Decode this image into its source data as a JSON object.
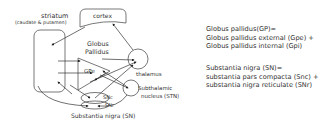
{
  "diagram": {
    "nodes": {
      "striatum": {
        "label": "striatum",
        "sublabel": "(caudate & putamen)"
      },
      "cortex": {
        "label": "cortex"
      },
      "globus_pallidus": {
        "label_line1": "Globus",
        "label_line2": "Pallidus"
      },
      "gpe": {
        "label": "GPe"
      },
      "gpi": {
        "label": "GPi"
      },
      "thalamus": {
        "label": "thalamus"
      },
      "stn": {
        "label_line1": "Subthalamic",
        "label_line2": "nucleus (STN)"
      },
      "snc": {
        "label": "SNc"
      },
      "snr": {
        "label": "SNr"
      },
      "substantia_nigra": {
        "label": "Substantia nigra (SN)"
      }
    },
    "edges": [
      {
        "from": "cortex",
        "to": "striatum"
      },
      {
        "from": "thalamus",
        "to": "cortex"
      },
      {
        "from": "striatum",
        "to": "gpe"
      },
      {
        "from": "striatum",
        "to": "gpi"
      },
      {
        "from": "gpe",
        "to": "thalamus"
      },
      {
        "from": "stn",
        "to": "gpi"
      },
      {
        "from": "gpe",
        "to": "stn"
      },
      {
        "from": "snc",
        "to": "striatum"
      },
      {
        "from": "gpi",
        "to": "snr"
      },
      {
        "from": "snr",
        "to": "thalamus"
      },
      {
        "from": "striatum",
        "to": "snr"
      }
    ]
  },
  "legend": {
    "gp": {
      "line1": "Globus pallidus(GP)=",
      "line2": "Globus pallidus external (Gpe) +",
      "line3": "Globus pallidus internal (Gpi)"
    },
    "sn": {
      "line1": "Substantia nigra (SN)=",
      "line2": "substantia pars compacta (Snc) +",
      "line3": "substantia nigra reticulate (SNr)"
    }
  }
}
